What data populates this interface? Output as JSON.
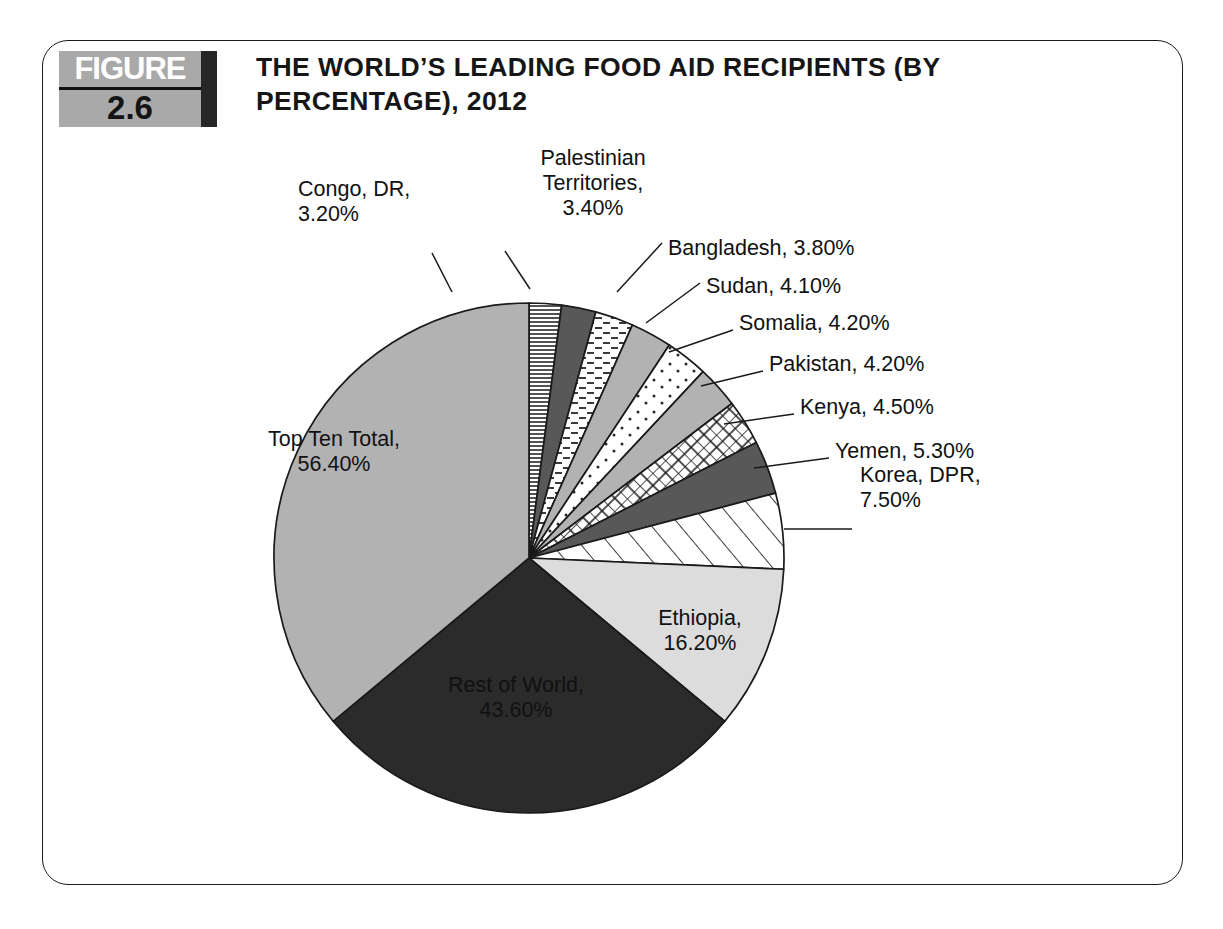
{
  "figure": {
    "badge_word": "FIGURE",
    "badge_number": "2.6",
    "title_line1": "THE WORLD’S LEADING FOOD AID RECIPIENTS (BY",
    "title_line2": "PERCENTAGE), 2012"
  },
  "colors": {
    "frame": "#1a1a1a",
    "badge_band": "#a9a9a9",
    "badge_endbar": "#262626",
    "outline": "#1a1a1a",
    "light_gray": "#dcdcdc",
    "medium_gray": "#b2b2b2",
    "dark_gray": "#585858",
    "near_black": "#2b2b2b",
    "white": "#ffffff"
  },
  "chart_data": {
    "type": "pie",
    "title": "THE WORLD’S LEADING FOOD AID RECIPIENTS (BY PERCENTAGE), 2012",
    "xlabel": "",
    "ylabel": "",
    "legend": "none",
    "value_unit": "%",
    "start_angle_deg": 0,
    "direction": "clockwise",
    "categories": [
      "Congo, DR",
      "Palestinian Territories",
      "Bangladesh",
      "Sudan",
      "Somalia",
      "Pakistan",
      "Kenya",
      "Yemen",
      "Korea, DPR",
      "Ethiopia",
      "Rest of World",
      "Top Ten Total"
    ],
    "values": [
      3.2,
      3.4,
      3.8,
      4.1,
      4.2,
      4.2,
      4.5,
      5.3,
      7.5,
      16.2,
      43.6,
      56.4
    ],
    "slices": [
      {
        "name": "Congo, DR",
        "value": 3.2,
        "value_text": "3.20%",
        "label_lines": [
          "Congo, DR,",
          "3.20%"
        ],
        "fill": "horizontal-lines",
        "base": "#ffffff",
        "label_placement": "outside",
        "label_x": 298,
        "label_y": 196,
        "label_anchor": "start",
        "leader": [
          [
            452,
            292
          ],
          [
            432,
            253
          ]
        ]
      },
      {
        "name": "Palestinian Territories",
        "value": 3.4,
        "value_text": "3.40%",
        "label_lines": [
          "Palestinian",
          "Territories,",
          "3.40%"
        ],
        "fill": "solid",
        "base": "#585858",
        "label_placement": "outside",
        "label_x": 593,
        "label_y": 165,
        "label_anchor": "middle",
        "leader": [
          [
            530,
            289
          ],
          [
            505,
            251
          ]
        ]
      },
      {
        "name": "Bangladesh",
        "value": 3.8,
        "value_text": "3.80%",
        "label_lines": [
          "Bangladesh, 3.80%"
        ],
        "fill": "dashes",
        "base": "#ffffff",
        "label_placement": "outside",
        "label_x": 668,
        "label_y": 255,
        "label_anchor": "start",
        "leader": [
          [
            662,
            243
          ],
          [
            617,
            292
          ]
        ]
      },
      {
        "name": "Sudan",
        "value": 4.1,
        "value_text": "4.10%",
        "label_lines": [
          "Sudan, 4.10%"
        ],
        "fill": "solid",
        "base": "#b2b2b2",
        "label_placement": "outside",
        "label_x": 706,
        "label_y": 293,
        "label_anchor": "start",
        "leader": [
          [
            700,
            283
          ],
          [
            646,
            323
          ]
        ]
      },
      {
        "name": "Somalia",
        "value": 4.2,
        "value_text": "4.20%",
        "label_lines": [
          "Somalia, 4.20%"
        ],
        "fill": "dots",
        "base": "#ffffff",
        "label_placement": "outside",
        "label_x": 739,
        "label_y": 330,
        "label_anchor": "start",
        "leader": [
          [
            733,
            330
          ],
          [
            669,
            352
          ]
        ]
      },
      {
        "name": "Pakistan",
        "value": 4.2,
        "value_text": "4.20%",
        "label_lines": [
          "Pakistan, 4.20%"
        ],
        "fill": "solid",
        "base": "#b2b2b2",
        "label_placement": "outside",
        "label_x": 769,
        "label_y": 371,
        "label_anchor": "start",
        "leader": [
          [
            763,
            371
          ],
          [
            701,
            386
          ]
        ]
      },
      {
        "name": "Kenya",
        "value": 4.5,
        "value_text": "4.50%",
        "label_lines": [
          "Kenya, 4.50%"
        ],
        "fill": "crosshatch",
        "base": "#ffffff",
        "label_placement": "outside",
        "label_x": 800,
        "label_y": 414,
        "label_anchor": "start",
        "leader": [
          [
            794,
            414
          ],
          [
            724,
            424
          ]
        ]
      },
      {
        "name": "Yemen",
        "value": 5.3,
        "value_text": "5.30%",
        "label_lines": [
          "Yemen, 5.30%"
        ],
        "fill": "solid",
        "base": "#585858",
        "label_placement": "outside",
        "label_x": 835,
        "label_y": 458,
        "label_anchor": "start",
        "leader": [
          [
            829,
            458
          ],
          [
            754,
            468
          ]
        ]
      },
      {
        "name": "Korea, DPR",
        "value": 7.5,
        "value_text": "7.50%",
        "label_lines": [
          "Korea, DPR,",
          "7.50%"
        ],
        "fill": "diagonal-stripes",
        "base": "#ffffff",
        "label_placement": "outside",
        "label_x": 860,
        "label_y": 482,
        "label_anchor": "start",
        "leader": [
          [
            852,
            529
          ],
          [
            784,
            529
          ]
        ]
      },
      {
        "name": "Ethiopia",
        "value": 16.2,
        "value_text": "16.20%",
        "label_lines": [
          "Ethiopia,",
          "16.20%"
        ],
        "fill": "solid",
        "base": "#dcdcdc",
        "label_placement": "inside",
        "label_x": 700,
        "label_y": 625,
        "label_anchor": "middle"
      },
      {
        "name": "Rest of World",
        "value": 43.6,
        "value_text": "43.60%",
        "label_lines": [
          "Rest of World,",
          "43.60%"
        ],
        "fill": "solid",
        "base": "#2b2b2b",
        "label_placement": "inside",
        "label_x": 516,
        "label_y": 692,
        "label_anchor": "middle",
        "text_color": "#ffffff"
      },
      {
        "name": "Top Ten Total",
        "value": 56.4,
        "value_text": "56.40%",
        "label_lines": [
          "Top Ten Total,",
          "56.40%"
        ],
        "fill": "solid",
        "base": "#b2b2b2",
        "label_placement": "inside",
        "label_x": 334,
        "label_y": 446,
        "label_anchor": "middle"
      }
    ],
    "geometry": {
      "cx": 529,
      "cy": 558,
      "r": 255
    }
  }
}
